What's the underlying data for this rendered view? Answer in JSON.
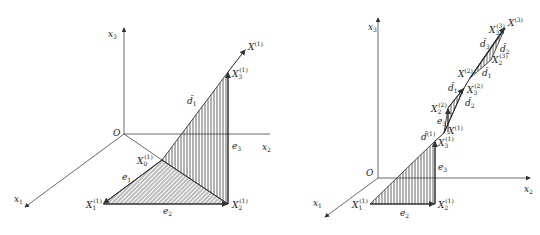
{
  "figures": [
    {
      "name": "left-figure",
      "axes": {
        "x1": "x",
        "x1_sub": "1",
        "x2": "x",
        "x2_sub": "2",
        "x3": "x",
        "x3_sub": "3",
        "origin": "O"
      },
      "points": {
        "X0": {
          "base": "X",
          "sub": "0",
          "sup": "(1)"
        },
        "X1": {
          "base": "X",
          "sub": "1",
          "sup": "(1)"
        },
        "X2": {
          "base": "X",
          "sub": "2",
          "sup": "(1)"
        },
        "X3": {
          "base": "X",
          "sub": "3",
          "sup": "(1)"
        },
        "Xk": {
          "base": "X",
          "sup": "(1)"
        }
      },
      "edges": {
        "e1": {
          "base": "e",
          "sub": "1"
        },
        "e2": {
          "base": "e",
          "sub": "2"
        },
        "e3": {
          "base": "e",
          "sub": "3"
        },
        "d1": {
          "base": "d̄",
          "sub": "1"
        }
      }
    },
    {
      "name": "right-figure",
      "axes": {
        "x1": "x",
        "x1_sub": "1",
        "x2": "x",
        "x2_sub": "2",
        "x3": "x",
        "x3_sub": "3",
        "origin": "O"
      },
      "points": {
        "X1_1": {
          "base": "X",
          "sub": "1",
          "sup": "(1)"
        },
        "X2_1": {
          "base": "X",
          "sub": "2",
          "sup": "(1)"
        },
        "X3_1": {
          "base": "X",
          "sub": "3",
          "sup": "(1)"
        },
        "X_1": {
          "base": "X",
          "sup": "(1)"
        },
        "X2_2": {
          "base": "X",
          "sub": "2",
          "sup": "(2)"
        },
        "X3_2": {
          "base": "X",
          "sub": "3",
          "sup": "(2)"
        },
        "X_2": {
          "base": "X",
          "sup": "(2)"
        },
        "X2_3": {
          "base": "X",
          "sub": "2",
          "sup": "(3)"
        },
        "X3_3": {
          "base": "X",
          "sub": "3",
          "sup": "(3)"
        },
        "X_3": {
          "base": "X",
          "sup": "(3)"
        }
      },
      "edges": {
        "e2": {
          "base": "e",
          "sub": "2"
        },
        "e3a": {
          "base": "e",
          "sub": "3"
        },
        "e3b": {
          "base": "e",
          "sub": "3"
        },
        "d_1": {
          "base": "d̄",
          "sup": "(1)"
        },
        "d1a": {
          "base": "d̄",
          "sub": "1"
        },
        "d2a": {
          "base": "d̄",
          "sub": "2"
        },
        "d1b": {
          "base": "d̄",
          "sub": "1"
        },
        "d3b": {
          "base": "d̄",
          "sub": "3"
        },
        "d2b": {
          "base": "d̄",
          "sub": "2"
        }
      }
    }
  ]
}
